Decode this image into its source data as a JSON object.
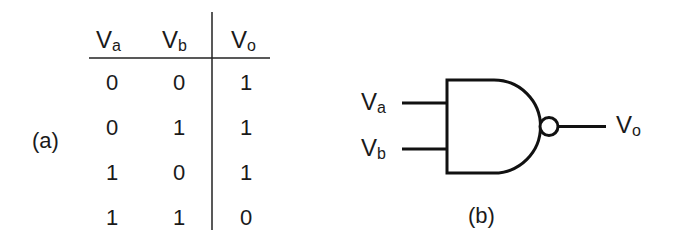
{
  "truth_table": {
    "caption": "(a)",
    "headers": [
      {
        "main": "V",
        "sub": "a"
      },
      {
        "main": "V",
        "sub": "b"
      },
      {
        "main": "V",
        "sub": "o"
      }
    ],
    "rows": [
      [
        "0",
        "0",
        "1"
      ],
      [
        "0",
        "1",
        "1"
      ],
      [
        "1",
        "0",
        "1"
      ],
      [
        "1",
        "1",
        "0"
      ]
    ]
  },
  "gate": {
    "type": "NAND",
    "caption": "(b)",
    "inputs": [
      {
        "main": "V",
        "sub": "a"
      },
      {
        "main": "V",
        "sub": "b"
      }
    ],
    "output": {
      "main": "V",
      "sub": "o"
    }
  }
}
